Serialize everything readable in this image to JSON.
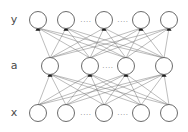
{
  "figure": {
    "background_color": "#ffffff",
    "width": 188,
    "height": 132
  },
  "style": {
    "node_fill": "#ffffff",
    "node_stroke": "#5a5a5a",
    "edge_color": "#6b6b6b",
    "arrow_color": "#1a1a1a",
    "label_color": "#4a4a4a",
    "ellipsis_color": "#8a8a8a",
    "node_radius": 8.5
  },
  "layers": [
    {
      "id": "output-layer",
      "label": "y",
      "label_x": 14,
      "label_y": 20,
      "cy": 20,
      "nodes": [
        {
          "name": "node-y-1",
          "cx": 38
        },
        {
          "name": "node-y-2",
          "cx": 66
        },
        {
          "name": "node-y-3",
          "cx": 104
        },
        {
          "name": "node-y-4",
          "cx": 141
        },
        {
          "name": "node-y-5",
          "cx": 169
        }
      ],
      "ellipses": [
        {
          "name": "ellipsis-y-left",
          "text": "....",
          "x": 86,
          "y": 20
        },
        {
          "name": "ellipsis-y-right",
          "text": "....",
          "x": 123,
          "y": 20
        }
      ]
    },
    {
      "id": "hidden-layer",
      "label": "a",
      "label_x": 14,
      "label_y": 66,
      "cy": 66,
      "nodes": [
        {
          "name": "node-a-1",
          "cx": 50
        },
        {
          "name": "node-a-2",
          "cx": 90
        },
        {
          "name": "node-a-3",
          "cx": 126
        },
        {
          "name": "node-a-4",
          "cx": 164
        }
      ],
      "ellipses": [
        {
          "name": "ellipsis-a-mid",
          "text": "....",
          "x": 108,
          "y": 66
        }
      ]
    },
    {
      "id": "input-layer",
      "label": "x",
      "label_x": 14,
      "label_y": 113,
      "cy": 113,
      "nodes": [
        {
          "name": "node-x-1",
          "cx": 38
        },
        {
          "name": "node-x-2",
          "cx": 66
        },
        {
          "name": "node-x-3",
          "cx": 104
        },
        {
          "name": "node-x-4",
          "cx": 141
        },
        {
          "name": "node-x-5",
          "cx": 169
        }
      ],
      "ellipses": [
        {
          "name": "ellipsis-x-left",
          "text": "....",
          "x": 86,
          "y": 113
        },
        {
          "name": "ellipsis-x-right",
          "text": "....",
          "x": 123,
          "y": 113
        }
      ]
    }
  ],
  "connections": [
    {
      "name": "edges-hidden-to-output",
      "from_layer": "hidden-layer",
      "to_layer": "output-layer",
      "fully_connected": true,
      "directed": true
    },
    {
      "name": "edges-input-to-hidden",
      "from_layer": "input-layer",
      "to_layer": "hidden-layer",
      "fully_connected": true,
      "directed": true
    }
  ]
}
